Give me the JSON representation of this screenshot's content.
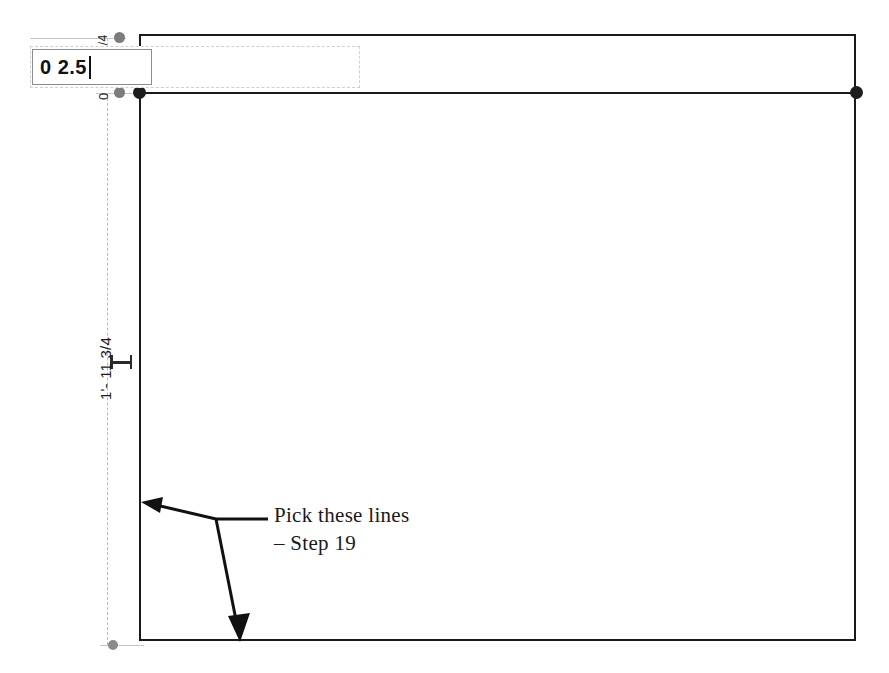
{
  "app": {
    "title": "Revit temporary dimension edit",
    "background_color": "#ffffff",
    "model_line_color": "#1a1a1a",
    "dimension_line_color": "#b9b9b9",
    "grip_dark_color": "#1d1d1d",
    "grip_gray_color": "#7c7c7c"
  },
  "edit_field": {
    "name": "temporary-dimension-input",
    "value": "0 2.5",
    "placeholder": "0 2.5",
    "has_caret": true
  },
  "dimensions": [
    {
      "id": "upper-offset",
      "label": "1/4",
      "orientation": "vertical-rotated",
      "position": "top"
    },
    {
      "id": "zero-offset",
      "label": "0",
      "orientation": "vertical-rotated",
      "position": "upper-left"
    },
    {
      "id": "overall-height",
      "label": "1'- 11 3/4",
      "orientation": "vertical-rotated",
      "position": "left"
    }
  ],
  "annotation": {
    "line1": "Pick these lines",
    "line2": "– Step 19",
    "arrow_count": 2
  },
  "geometry": {
    "rectangle": {
      "x": 139,
      "y": 34,
      "width": 717,
      "height": 607
    },
    "interior_horizontal_line_y": 92,
    "grips": [
      {
        "id": "grip-top-offset",
        "x": 120,
        "y": 38,
        "style": "gray"
      },
      {
        "id": "grip-zero-offset",
        "x": 120,
        "y": 93,
        "style": "gray"
      },
      {
        "id": "grip-wall-top-left",
        "x": 139,
        "y": 93,
        "style": "dark"
      },
      {
        "id": "grip-wall-top-right",
        "x": 856,
        "y": 93,
        "style": "dark"
      },
      {
        "id": "grip-dim-bottom",
        "x": 113,
        "y": 645,
        "style": "gray-sm"
      }
    ]
  }
}
